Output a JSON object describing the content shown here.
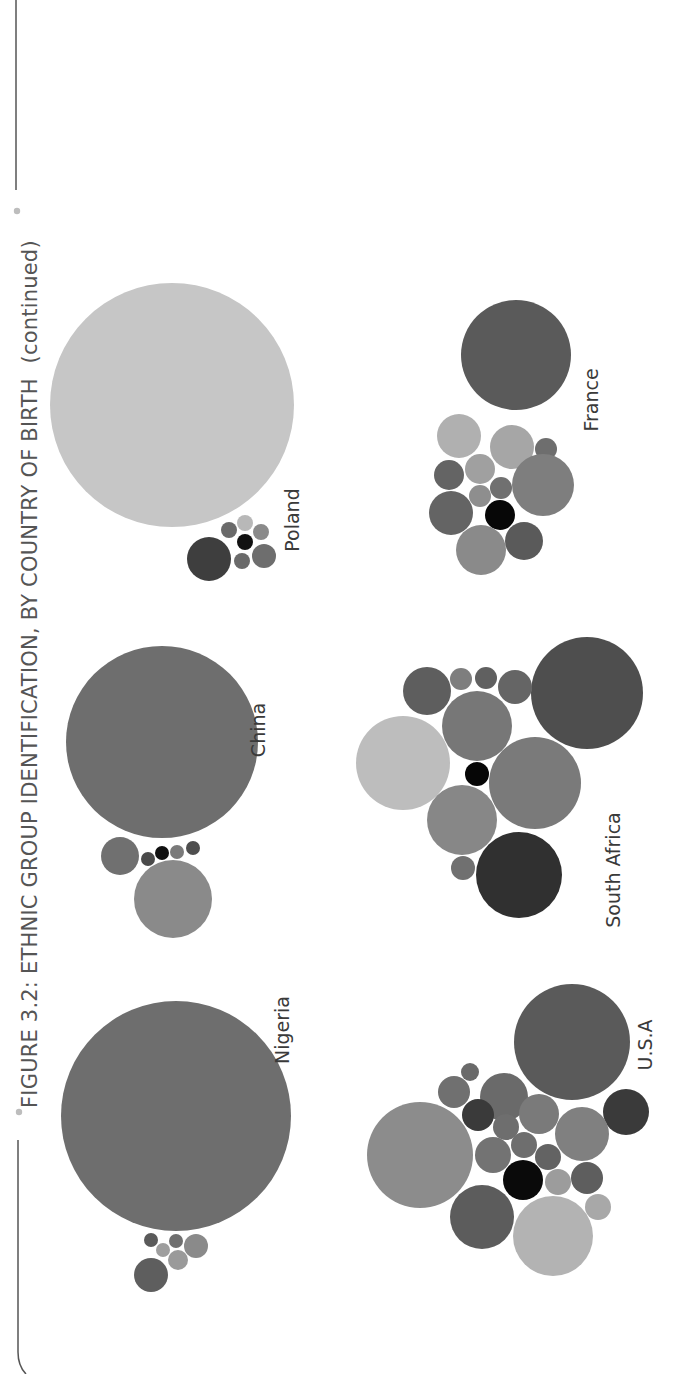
{
  "figure": {
    "title": "FIGURE 3.2: ETHNIC GROUP IDENTIFICATION, BY COUNTRY OF BIRTH",
    "title_suffix": "(continued)",
    "orientation": "rotated-90-ccw",
    "colors": {
      "frame": "#555555",
      "bullet": "#bdbdbd",
      "title": "#555555",
      "label": "#3a3a3a"
    }
  },
  "chart_data": {
    "type": "bubble-cluster",
    "title": "FIGURE 3.2: ETHNIC GROUP IDENTIFICATION, BY COUNTRY OF BIRTH (continued)",
    "xlabel": "",
    "ylabel": "",
    "grid": false,
    "legend": null,
    "note": "Packed-bubble clusters, one per country of birth; bubble area ~ share of respondents identifying with each ethnic group. Greyscale shades distinguish ethnic groups. Coordinates are screen pixels of the rotated page.",
    "clusters": [
      {
        "country": "Nigeria",
        "label_pos": [
          289,
          1030
        ],
        "bubbles": [
          {
            "cx": 176,
            "cy": 1116,
            "r": 115,
            "fill": "#6e6e6e"
          },
          {
            "cx": 151,
            "cy": 1275,
            "r": 17,
            "fill": "#5e5e5e"
          },
          {
            "cx": 151,
            "cy": 1240,
            "r": 7,
            "fill": "#5a5a5a"
          },
          {
            "cx": 163,
            "cy": 1250,
            "r": 7,
            "fill": "#9e9e9e"
          },
          {
            "cx": 176,
            "cy": 1241,
            "r": 7,
            "fill": "#6f6f6f"
          },
          {
            "cx": 178,
            "cy": 1260,
            "r": 10,
            "fill": "#9a9a9a"
          },
          {
            "cx": 196,
            "cy": 1246,
            "r": 12,
            "fill": "#8a8a8a"
          }
        ]
      },
      {
        "country": "China",
        "label_pos": [
          265,
          730
        ],
        "bubbles": [
          {
            "cx": 162,
            "cy": 742,
            "r": 96,
            "fill": "#6e6e6e"
          },
          {
            "cx": 120,
            "cy": 856,
            "r": 19,
            "fill": "#707070"
          },
          {
            "cx": 148,
            "cy": 859,
            "r": 7,
            "fill": "#4a4a4a"
          },
          {
            "cx": 162,
            "cy": 853,
            "r": 7,
            "fill": "#111111"
          },
          {
            "cx": 177,
            "cy": 852,
            "r": 7,
            "fill": "#7a7a7a"
          },
          {
            "cx": 193,
            "cy": 848,
            "r": 7,
            "fill": "#4e4e4e"
          },
          {
            "cx": 173,
            "cy": 899,
            "r": 39,
            "fill": "#8a8a8a"
          }
        ]
      },
      {
        "country": "Poland",
        "label_pos": [
          299,
          520
        ],
        "bubbles": [
          {
            "cx": 172,
            "cy": 405,
            "r": 122,
            "fill": "#c6c6c6"
          },
          {
            "cx": 209,
            "cy": 559,
            "r": 22,
            "fill": "#3e3e3e"
          },
          {
            "cx": 229,
            "cy": 530,
            "r": 8,
            "fill": "#6a6a6a"
          },
          {
            "cx": 245,
            "cy": 523,
            "r": 8,
            "fill": "#b8b8b8"
          },
          {
            "cx": 245,
            "cy": 542,
            "r": 8,
            "fill": "#111111"
          },
          {
            "cx": 261,
            "cy": 532,
            "r": 8,
            "fill": "#8a8a8a"
          },
          {
            "cx": 242,
            "cy": 561,
            "r": 8,
            "fill": "#6a6a6a"
          },
          {
            "cx": 264,
            "cy": 556,
            "r": 12,
            "fill": "#6e6e6e"
          }
        ]
      },
      {
        "country": "U.S.A",
        "label_pos": [
          652,
          1045
        ],
        "bubbles": [
          {
            "cx": 572,
            "cy": 1042,
            "r": 58,
            "fill": "#5a5a5a"
          },
          {
            "cx": 626,
            "cy": 1112,
            "r": 23,
            "fill": "#3a3a3a"
          },
          {
            "cx": 420,
            "cy": 1155,
            "r": 53,
            "fill": "#8c8c8c"
          },
          {
            "cx": 504,
            "cy": 1097,
            "r": 24,
            "fill": "#6a6a6a"
          },
          {
            "cx": 454,
            "cy": 1092,
            "r": 16,
            "fill": "#707070"
          },
          {
            "cx": 470,
            "cy": 1072,
            "r": 9,
            "fill": "#6a6a6a"
          },
          {
            "cx": 478,
            "cy": 1115,
            "r": 16,
            "fill": "#3a3a3a"
          },
          {
            "cx": 506,
            "cy": 1127,
            "r": 13,
            "fill": "#6e6e6e"
          },
          {
            "cx": 539,
            "cy": 1114,
            "r": 20,
            "fill": "#7a7a7a"
          },
          {
            "cx": 582,
            "cy": 1134,
            "r": 27,
            "fill": "#808080"
          },
          {
            "cx": 493,
            "cy": 1155,
            "r": 18,
            "fill": "#737373"
          },
          {
            "cx": 524,
            "cy": 1145,
            "r": 13,
            "fill": "#6e6e6e"
          },
          {
            "cx": 548,
            "cy": 1157,
            "r": 13,
            "fill": "#636363"
          },
          {
            "cx": 523,
            "cy": 1180,
            "r": 20,
            "fill": "#0a0a0a"
          },
          {
            "cx": 558,
            "cy": 1182,
            "r": 13,
            "fill": "#9c9c9c"
          },
          {
            "cx": 587,
            "cy": 1178,
            "r": 16,
            "fill": "#5e5e5e"
          },
          {
            "cx": 598,
            "cy": 1207,
            "r": 13,
            "fill": "#a8a8a8"
          },
          {
            "cx": 482,
            "cy": 1217,
            "r": 32,
            "fill": "#5c5c5c"
          },
          {
            "cx": 553,
            "cy": 1236,
            "r": 40,
            "fill": "#b3b3b3"
          }
        ]
      },
      {
        "country": "South Africa",
        "label_pos": [
          620,
          870
        ],
        "bubbles": [
          {
            "cx": 587,
            "cy": 693,
            "r": 56,
            "fill": "#4e4e4e"
          },
          {
            "cx": 427,
            "cy": 691,
            "r": 24,
            "fill": "#5e5e5e"
          },
          {
            "cx": 461,
            "cy": 679,
            "r": 11,
            "fill": "#7e7e7e"
          },
          {
            "cx": 486,
            "cy": 678,
            "r": 11,
            "fill": "#606060"
          },
          {
            "cx": 515,
            "cy": 687,
            "r": 17,
            "fill": "#656565"
          },
          {
            "cx": 477,
            "cy": 726,
            "r": 35,
            "fill": "#777777"
          },
          {
            "cx": 403,
            "cy": 763,
            "r": 47,
            "fill": "#bdbdbd"
          },
          {
            "cx": 477,
            "cy": 774,
            "r": 12,
            "fill": "#060606"
          },
          {
            "cx": 535,
            "cy": 783,
            "r": 46,
            "fill": "#7a7a7a"
          },
          {
            "cx": 462,
            "cy": 820,
            "r": 35,
            "fill": "#878787"
          },
          {
            "cx": 463,
            "cy": 868,
            "r": 12,
            "fill": "#707070"
          },
          {
            "cx": 519,
            "cy": 875,
            "r": 43,
            "fill": "#303030"
          }
        ]
      },
      {
        "country": "France",
        "label_pos": [
          598,
          400
        ],
        "bubbles": [
          {
            "cx": 516,
            "cy": 355,
            "r": 55,
            "fill": "#5a5a5a"
          },
          {
            "cx": 459,
            "cy": 436,
            "r": 22,
            "fill": "#b0b0b0"
          },
          {
            "cx": 512,
            "cy": 447,
            "r": 22,
            "fill": "#a6a6a6"
          },
          {
            "cx": 546,
            "cy": 449,
            "r": 11,
            "fill": "#6e6e6e"
          },
          {
            "cx": 449,
            "cy": 475,
            "r": 15,
            "fill": "#646464"
          },
          {
            "cx": 480,
            "cy": 469,
            "r": 15,
            "fill": "#a0a0a0"
          },
          {
            "cx": 501,
            "cy": 488,
            "r": 11,
            "fill": "#707070"
          },
          {
            "cx": 480,
            "cy": 496,
            "r": 11,
            "fill": "#8e8e8e"
          },
          {
            "cx": 543,
            "cy": 485,
            "r": 31,
            "fill": "#7e7e7e"
          },
          {
            "cx": 451,
            "cy": 513,
            "r": 22,
            "fill": "#646464"
          },
          {
            "cx": 500,
            "cy": 515,
            "r": 15,
            "fill": "#070707"
          },
          {
            "cx": 481,
            "cy": 550,
            "r": 25,
            "fill": "#8a8a8a"
          },
          {
            "cx": 524,
            "cy": 541,
            "r": 19,
            "fill": "#5a5a5a"
          }
        ]
      }
    ]
  }
}
